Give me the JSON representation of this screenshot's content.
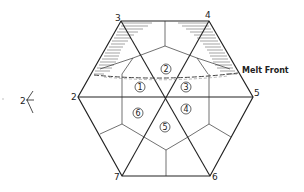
{
  "diagram": {
    "type": "hexagonal mesh with melt front",
    "vertices": [
      {
        "id": "2",
        "label": "2",
        "x": 78,
        "y": 97
      },
      {
        "id": "3",
        "label": "3",
        "x": 121,
        "y": 21
      },
      {
        "id": "4",
        "label": "4",
        "x": 209,
        "y": 21
      },
      {
        "id": "5",
        "label": "5",
        "x": 253,
        "y": 97
      },
      {
        "id": "6",
        "label": "6",
        "x": 210,
        "y": 176
      },
      {
        "id": "7",
        "label": "7",
        "x": 122,
        "y": 176
      }
    ],
    "cells": [
      {
        "id": "1",
        "label": "1",
        "x": 140,
        "y": 87
      },
      {
        "id": "2",
        "label": "2",
        "x": 166,
        "y": 69
      },
      {
        "id": "3",
        "label": "3",
        "x": 186,
        "y": 87
      },
      {
        "id": "4",
        "label": "4",
        "x": 186,
        "y": 109
      },
      {
        "id": "5",
        "label": "5",
        "x": 165,
        "y": 127
      },
      {
        "id": "6",
        "label": "6",
        "x": 138,
        "y": 113
      }
    ],
    "melt_front_label": "Melt Front",
    "side_annotation": "2",
    "colors": {
      "line": "#222222",
      "hatch": "#555555",
      "background": "#ffffff"
    }
  }
}
